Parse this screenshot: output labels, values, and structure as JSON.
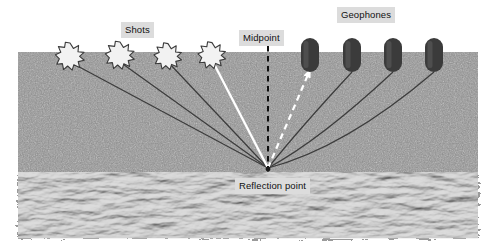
{
  "diagram": {
    "title_visible": false,
    "labels": {
      "shots": "Shots",
      "midpoint": "Midpoint",
      "geophones": "Geophones",
      "reflection_point": "Reflection point"
    },
    "colors": {
      "soil": "#8a8a8a",
      "bedrock": "#9a9a9a",
      "geophone": "#3b3b3b",
      "shot_fill": "#f2f2f2",
      "shot_outline": "#3a3a3a",
      "ray_dark": "#3c3c3c",
      "ray_white": "#ffffff",
      "midpoint_line": "#101010",
      "label_bg": "#dcdcdc",
      "label_text": "#111111",
      "page_bg": "#ffffff"
    },
    "geometry": {
      "ground_left": 18,
      "ground_right": 478,
      "surface_y": 52,
      "bedrock_top_y": 176,
      "bedrock_bottom_y": 238,
      "reflection_point": {
        "x": 268,
        "y": 168
      },
      "midpoint_x": 268
    },
    "shots": [
      {
        "id": "shot-1",
        "x": 70,
        "y": 56,
        "ray": "dark"
      },
      {
        "id": "shot-2",
        "x": 120,
        "y": 55,
        "ray": "dark"
      },
      {
        "id": "shot-3",
        "x": 168,
        "y": 56,
        "ray": "dark"
      },
      {
        "id": "shot-4",
        "x": 212,
        "y": 55,
        "ray": "white"
      }
    ],
    "geophones": [
      {
        "id": "geophone-1",
        "x": 310,
        "y_top": 38,
        "y_bottom": 72,
        "ray": "white-dashed-arrow"
      },
      {
        "id": "geophone-2",
        "x": 352,
        "y_top": 38,
        "y_bottom": 72,
        "ray": "dark"
      },
      {
        "id": "geophone-3",
        "x": 393,
        "y_top": 38,
        "y_bottom": 72,
        "ray": "dark"
      },
      {
        "id": "geophone-4",
        "x": 434,
        "y_top": 38,
        "y_bottom": 72,
        "ray": "dark"
      }
    ]
  }
}
